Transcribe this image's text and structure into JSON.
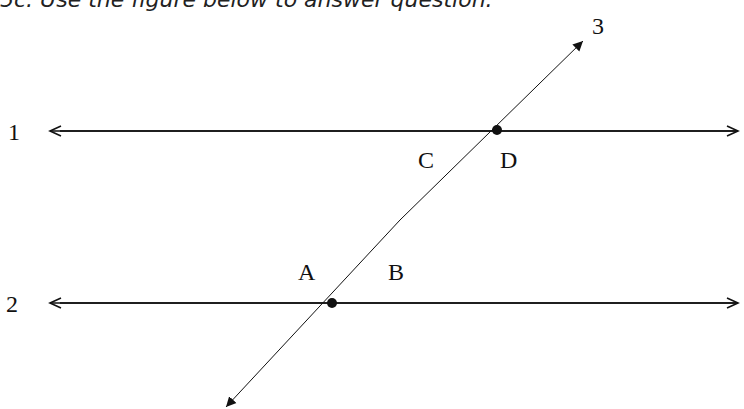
{
  "caption": "5c. Use the figure below to answer question.",
  "diagram": {
    "lines": [
      {
        "id": "1",
        "label": "1",
        "type": "horizontal",
        "y": 131
      },
      {
        "id": "2",
        "label": "2",
        "type": "horizontal",
        "y": 303
      },
      {
        "id": "3",
        "label": "3",
        "type": "transversal"
      }
    ],
    "angle_labels": {
      "A": "A",
      "B": "B",
      "C": "C",
      "D": "D"
    },
    "intersections": [
      {
        "lines": [
          "1",
          "3"
        ],
        "x": 497,
        "y": 130
      },
      {
        "lines": [
          "2",
          "3"
        ],
        "x": 332,
        "y": 303
      }
    ],
    "colors": {
      "stroke": "#111111",
      "background": "#ffffff"
    }
  }
}
